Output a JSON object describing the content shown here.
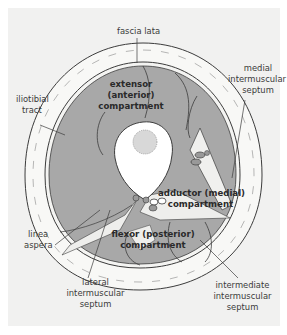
{
  "diagram": {
    "colors": {
      "background": "#f1f1f0",
      "skin_fat": "#f7f7f5",
      "muscle": "#a7a7a7",
      "bone": "#ffffff",
      "marrow": "#d9d9d9",
      "outline": "#3c3c3c"
    },
    "labels": {
      "fascia_lata": "fascia lata",
      "medial_septum_1": "medial",
      "medial_septum_2": "intermuscular",
      "medial_septum_3": "septum",
      "iliotibial_1": "iliotibial",
      "iliotibial_2": "tract",
      "linea_1": "linea",
      "linea_2": "aspera",
      "lateral_septum_1": "lateral",
      "lateral_septum_2": "intermuscular",
      "lateral_septum_3": "septum",
      "intermediate_septum_1": "intermediate",
      "intermediate_septum_2": "intermuscular",
      "intermediate_septum_3": "septum"
    },
    "compartments": {
      "extensor_1": "extensor",
      "extensor_2": "(anterior)",
      "extensor_3": "compartment",
      "adductor_1": "adductor (medial)",
      "adductor_2": "compartment",
      "flexor_1": "flexor (posterior)",
      "flexor_2": "compartment"
    }
  }
}
